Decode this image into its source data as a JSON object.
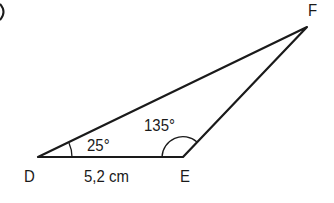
{
  "figure": {
    "corner_fragment": ")",
    "vertices": {
      "D": {
        "label": "D"
      },
      "E": {
        "label": "E"
      },
      "F": {
        "label": "F"
      }
    },
    "angles": {
      "at_D": "25°",
      "at_E": "135°"
    },
    "sides": {
      "DE": "5,2 cm"
    },
    "colors": {
      "stroke": "#1a1a1a",
      "background": "#ffffff"
    }
  }
}
